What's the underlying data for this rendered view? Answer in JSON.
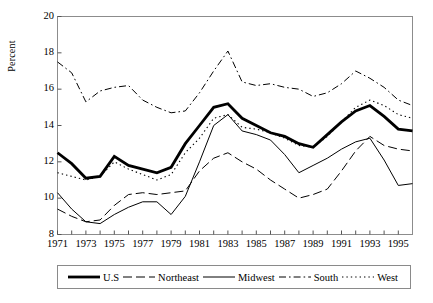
{
  "chart_data": {
    "type": "line",
    "title": "",
    "xlabel": "",
    "ylabel": "Percent",
    "xlim": [
      1971,
      1996
    ],
    "ylim": [
      8,
      20
    ],
    "ytick_step": 2,
    "ytick_labels": [
      "8",
      "10",
      "12",
      "14",
      "16",
      "18",
      "20"
    ],
    "xtick_labels": [
      "1971",
      "1973",
      "1975",
      "1977",
      "1979",
      "1981",
      "1983",
      "1985",
      "1987",
      "1989",
      "1991",
      "1993",
      "1995"
    ],
    "x_minor_ticks_every": 1,
    "grid": false,
    "legend_position": "bottom",
    "x": [
      1971,
      1972,
      1973,
      1974,
      1975,
      1976,
      1977,
      1978,
      1979,
      1980,
      1981,
      1982,
      1983,
      1984,
      1985,
      1986,
      1987,
      1988,
      1989,
      1990,
      1991,
      1992,
      1993,
      1994,
      1995,
      1996
    ],
    "series": [
      {
        "name": "U.S",
        "style": "solid-thick",
        "color": "#000000",
        "width": 2.8,
        "dash": "",
        "values": [
          12.5,
          11.9,
          11.1,
          11.2,
          12.3,
          11.8,
          11.6,
          11.4,
          11.7,
          13.0,
          14.0,
          15.0,
          15.2,
          14.4,
          14.0,
          13.6,
          13.4,
          13.0,
          12.8,
          13.5,
          14.2,
          14.8,
          15.1,
          14.5,
          13.8,
          13.7
        ]
      },
      {
        "name": "Northeast",
        "style": "long-dash",
        "color": "#000000",
        "width": 1.0,
        "dash": "9,4",
        "values": [
          9.4,
          9.0,
          8.7,
          8.8,
          9.6,
          10.2,
          10.3,
          10.2,
          10.3,
          10.4,
          11.5,
          12.2,
          12.5,
          12.0,
          11.6,
          11.0,
          10.5,
          10.0,
          10.2,
          10.5,
          11.5,
          12.6,
          13.4,
          12.9,
          12.7,
          12.6
        ]
      },
      {
        "name": "Midwest",
        "style": "solid-thin",
        "color": "#000000",
        "width": 1.0,
        "dash": "",
        "values": [
          10.3,
          9.4,
          8.7,
          8.6,
          9.1,
          9.5,
          9.8,
          9.8,
          9.1,
          10.1,
          12.0,
          14.0,
          14.6,
          13.7,
          13.5,
          13.2,
          12.4,
          11.4,
          11.8,
          12.2,
          12.7,
          13.1,
          13.3,
          12.1,
          10.7,
          10.8
        ]
      },
      {
        "name": "South",
        "style": "dash-dot",
        "color": "#000000",
        "width": 1.0,
        "dash": "7,3,1.6,3",
        "values": [
          17.5,
          16.9,
          15.3,
          15.9,
          16.1,
          16.2,
          15.4,
          15.0,
          14.7,
          14.8,
          15.8,
          17.0,
          18.1,
          16.4,
          16.2,
          16.3,
          16.1,
          16.0,
          15.6,
          15.8,
          16.3,
          17.0,
          16.6,
          16.1,
          15.4,
          15.1
        ]
      },
      {
        "name": "West",
        "style": "dotted",
        "color": "#000000",
        "width": 1.1,
        "dash": "1.4,3",
        "values": [
          11.4,
          11.2,
          11.0,
          11.2,
          12.0,
          11.6,
          11.3,
          11.0,
          11.3,
          12.5,
          13.3,
          14.4,
          14.6,
          13.9,
          13.8,
          13.6,
          13.3,
          12.9,
          12.8,
          13.4,
          14.2,
          15.0,
          15.4,
          15.1,
          14.6,
          14.4
        ]
      }
    ]
  },
  "legend": {
    "items": [
      {
        "label": "U.S"
      },
      {
        "label": "Northeast"
      },
      {
        "label": "Midwest"
      },
      {
        "label": "South"
      },
      {
        "label": "West"
      }
    ]
  }
}
